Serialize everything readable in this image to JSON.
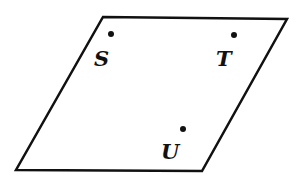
{
  "diagram": {
    "type": "plane-with-points",
    "plane": {
      "shape": "parallelogram",
      "vertices": [
        [
          103,
          17
        ],
        [
          287,
          19
        ],
        [
          202,
          171
        ],
        [
          16,
          170
        ]
      ],
      "stroke": "#111111"
    },
    "points": [
      {
        "label": "S",
        "dot": [
          111,
          34
        ],
        "label_pos": [
          94,
          66
        ]
      },
      {
        "label": "T",
        "dot": [
          234,
          35
        ],
        "label_pos": [
          216,
          66
        ]
      },
      {
        "label": "U",
        "dot": [
          183,
          129
        ],
        "label_pos": [
          161,
          159
        ]
      }
    ]
  }
}
